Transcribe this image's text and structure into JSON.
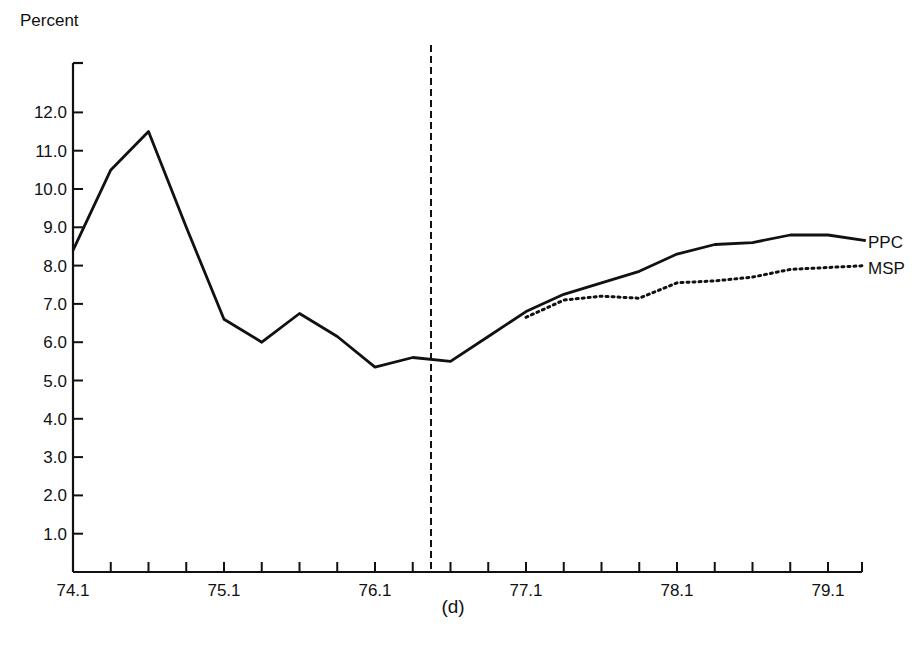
{
  "chart_data": {
    "type": "line",
    "title": "",
    "panel_label": "(d)",
    "xlabel": "",
    "ylabel": "Percent",
    "ylim": [
      0,
      13.0
    ],
    "yticks": [
      "1.0",
      "2.0",
      "3.0",
      "4.0",
      "5.0",
      "6.0",
      "7.0",
      "8.0",
      "9.0",
      "10.0",
      "11.0",
      "12.0"
    ],
    "xtick_labels": [
      "74.1",
      "75.1",
      "76.1",
      "77.1",
      "78.1",
      "79.1"
    ],
    "x": [
      "74.1",
      "74.2",
      "74.3",
      "74.4",
      "75.1",
      "75.2",
      "75.3",
      "75.4",
      "76.1",
      "76.2",
      "76.3",
      "76.4",
      "77.1",
      "77.2",
      "77.3",
      "77.4",
      "78.1",
      "78.2",
      "78.3",
      "78.4",
      "79.1",
      "79.2"
    ],
    "grid": false,
    "legend": "inline-right",
    "annotations": [
      {
        "type": "vertical-dashed-line",
        "x": "76.3 (between 76.2 and 76.3)"
      }
    ],
    "series": [
      {
        "name": "PPC",
        "style": "solid",
        "values": [
          8.4,
          10.5,
          11.5,
          9.0,
          6.6,
          6.0,
          6.75,
          6.15,
          5.35,
          5.6,
          5.5,
          6.15,
          6.8,
          7.25,
          7.55,
          7.85,
          8.3,
          8.55,
          8.6,
          8.8,
          8.8,
          8.65
        ]
      },
      {
        "name": "MSP",
        "style": "dotted",
        "values": [
          null,
          null,
          null,
          null,
          null,
          null,
          null,
          null,
          null,
          null,
          null,
          null,
          6.65,
          7.1,
          7.2,
          7.15,
          7.55,
          7.6,
          7.7,
          7.9,
          7.95,
          8.0
        ]
      }
    ]
  },
  "labels": {
    "ylabel": "Percent",
    "panel": "(d)",
    "ppc": "PPC",
    "msp": "MSP"
  }
}
